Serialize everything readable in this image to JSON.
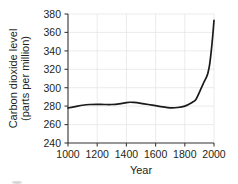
{
  "chart_data": {
    "type": "line",
    "title": "",
    "xlabel": "Year",
    "ylabel": "Carbon dioxide level (parts per million)",
    "ylabel_line1": "Carbon dioxide level",
    "ylabel_line2": "(parts per million)",
    "xlim": [
      1000,
      2000
    ],
    "ylim": [
      240,
      380
    ],
    "xticks": [
      1000,
      1200,
      1400,
      1600,
      1800,
      2000
    ],
    "yticks": [
      240,
      260,
      280,
      300,
      320,
      340,
      360,
      380
    ],
    "xtick_labels": [
      "1000",
      "1200",
      "1400",
      "1600",
      "1800",
      "2000"
    ],
    "ytick_labels": [
      "240",
      "260",
      "280",
      "300",
      "320",
      "340",
      "360",
      "380"
    ],
    "grid": true,
    "legend": false,
    "line_color": "#1a1a1a",
    "grid_color": "#e3e3e6",
    "axis_color": "#3b3b3d",
    "x": [
      1000,
      1050,
      1100,
      1150,
      1200,
      1250,
      1300,
      1350,
      1400,
      1425,
      1450,
      1500,
      1550,
      1600,
      1650,
      1700,
      1750,
      1800,
      1850,
      1875,
      1900,
      1925,
      1950,
      1960,
      1970,
      1980,
      1990,
      2000
    ],
    "values": [
      278.0,
      279.5,
      281.0,
      281.8,
      282.0,
      281.8,
      281.8,
      282.5,
      283.8,
      284.2,
      284.0,
      283.0,
      281.8,
      280.5,
      279.2,
      278.2,
      278.5,
      280.0,
      284.0,
      287.0,
      295.0,
      304.0,
      312.0,
      317.0,
      325.0,
      338.0,
      354.0,
      373.0
    ]
  },
  "annotations": {
    "corner_mark": ""
  }
}
